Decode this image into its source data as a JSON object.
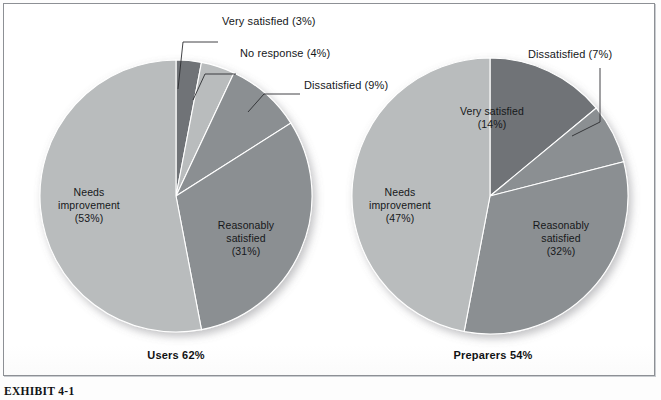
{
  "exhibit": {
    "caption": "EXHIBIT 4-1",
    "frame_border_color": "#8d9095"
  },
  "chart_data": {
    "type": "pie",
    "title": "",
    "legend_position": "none",
    "grid": false,
    "charts": [
      {
        "name": "users",
        "caption": "Users 62%",
        "center": [
          176,
          196
        ],
        "radius": 136,
        "start_angle_deg": 0,
        "slices": [
          {
            "label": "Very satisfied",
            "pct_text": "(3%)",
            "value": 3,
            "color": "#6f7377",
            "label_style": "callout"
          },
          {
            "label": "No response",
            "pct_text": "(4%)",
            "value": 4,
            "color": "#b9bcbd",
            "label_style": "callout"
          },
          {
            "label": "Dissatisfied",
            "pct_text": "(9%)",
            "value": 9,
            "color": "#8b8f92",
            "label_style": "callout"
          },
          {
            "label": "Reasonably\nsatisfied",
            "pct_text": "(31%)",
            "value": 31,
            "color": "#8b8f92",
            "label_style": "inside"
          },
          {
            "label": "Needs\nimprovement",
            "pct_text": "(53%)",
            "value": 53,
            "color": "#b9bcbd",
            "label_style": "inside"
          }
        ],
        "callouts": [
          {
            "text": "Very satisfied (3%)",
            "x": 222,
            "y": 19
          },
          {
            "text": "No response (4%)",
            "x": 240,
            "y": 51
          },
          {
            "text": "Dissatisfied (9%)",
            "x": 272,
            "y": 83
          }
        ],
        "inside_labels": [
          {
            "text": "Needs\nimprovement\n(53%)",
            "x": 68,
            "y": 188
          },
          {
            "text": "Reasonably\nsatisfied\n(31%)",
            "x": 198,
            "y": 222
          }
        ]
      },
      {
        "name": "preparers",
        "caption": "Preparers 54%",
        "center": [
          490,
          196
        ],
        "radius": 138,
        "start_angle_deg": 0,
        "slices": [
          {
            "label": "Very satisfied",
            "pct_text": "(14%)",
            "value": 14,
            "color": "#6f7377",
            "label_style": "inside"
          },
          {
            "label": "Dissatisfied",
            "pct_text": "(7%)",
            "value": 7,
            "color": "#8b8f92",
            "label_style": "callout"
          },
          {
            "label": "Reasonably\nsatisfied",
            "pct_text": "(32%)",
            "value": 32,
            "color": "#8b8f92",
            "label_style": "inside"
          },
          {
            "label": "Needs\nimprovement",
            "pct_text": "(47%)",
            "value": 47,
            "color": "#b9bcbd",
            "label_style": "inside"
          }
        ],
        "callouts": [
          {
            "text": "Dissatisfied (7%)",
            "x": 528,
            "y": 52
          }
        ],
        "inside_labels": [
          {
            "text": "Very satisfied\n(14%)",
            "x": 487,
            "y": 110
          },
          {
            "text": "Needs\nimprovement\n(47%)",
            "x": 385,
            "y": 188
          },
          {
            "text": "Reasonably\nsatisfied\n(32%)",
            "x": 513,
            "y": 222
          }
        ]
      }
    ]
  },
  "labels": {
    "users_caption": "Users 62%",
    "preparers_caption": "Preparers 54%",
    "l_very_satisfied": "Very satisfied (3%)",
    "l_no_response": "No response (4%)",
    "l_dissatisfied": "Dissatisfied (9%)",
    "l_needs_improvement": "Needs\nimprovement\n(53%)",
    "l_reasonably_satisfied": "Reasonably\nsatisfied\n(31%)",
    "r_dissatisfied": "Dissatisfied (7%)",
    "r_very_satisfied": "Very satisfied\n(14%)",
    "r_needs_improvement": "Needs\nimprovement\n(47%)",
    "r_reasonably_satisfied": "Reasonably\nsatisfied\n(32%)"
  }
}
